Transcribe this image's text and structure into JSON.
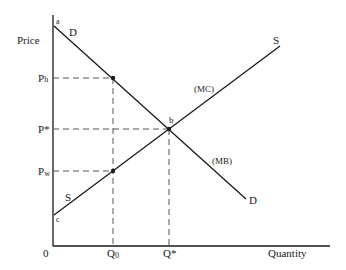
{
  "axes": {
    "y_label": "Price",
    "x_label": "Quantity",
    "origin_label": "0"
  },
  "price_ticks": [
    {
      "id": "ph",
      "label": "P",
      "sub": "h",
      "y": 78
    },
    {
      "id": "pstar",
      "label": "P*",
      "sub": "",
      "y": 129
    },
    {
      "id": "pw",
      "label": "P",
      "sub": "w",
      "y": 171
    }
  ],
  "quantity_ticks": [
    {
      "id": "q0",
      "label": "Q",
      "sub": "0",
      "x": 113
    },
    {
      "id": "qstar",
      "label": "Q*",
      "sub": "",
      "x": 169
    }
  ],
  "curves": {
    "demand": {
      "label_top": "D",
      "label_bottom": "D",
      "annotation": "(MB)",
      "start_point": "a"
    },
    "supply": {
      "label_top": "S",
      "label_bottom": "S",
      "annotation": "(MC)",
      "start_point": "c"
    }
  },
  "points": {
    "a": "a",
    "b": "b",
    "c": "c"
  },
  "colors": {
    "line": "#1a1a1a",
    "dash": "#555555"
  }
}
